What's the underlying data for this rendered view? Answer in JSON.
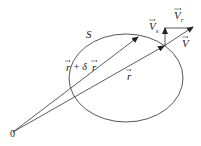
{
  "diagram": {
    "surface_label": "S",
    "origin_label": "0",
    "position_label": "r",
    "displaced_position_label": "r + δr",
    "velocity_label": "V",
    "surface_velocity_label": "Vs",
    "relative_velocity_label": "Vr",
    "labels": {
      "S": "S",
      "origin": "0",
      "r_sym": "r",
      "r_plus_sym": "r",
      "plus": "+ δ",
      "r_plus_sym2": "r",
      "V": "V",
      "Vs_main": "V",
      "Vs_sub": "s",
      "Vr_main": "V",
      "Vr_sub": "r"
    },
    "stroke_color": "#333333"
  }
}
